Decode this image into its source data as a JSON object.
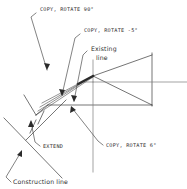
{
  "diagram": {
    "background_color": "#ffffff",
    "line_color": "#3a3a3a",
    "accent_line_color": "#7d7d7d",
    "width": 187,
    "height": 189,
    "labels": {
      "copy_rotate_90": "COPY, ROTATE 90°",
      "copy_rotate_minus5": "COPY, ROTATE -5°",
      "existing_line_1": "Existing",
      "existing_line_2": "line",
      "extend": "EXTEND",
      "copy_rotate_6": "COPY, ROTATE 6°",
      "construction_line": "Construction line"
    },
    "annotations": [
      {
        "name": "copy-rotate-90",
        "text": "COPY, ROTATE 90°",
        "style": "uppercase",
        "text_x": 40,
        "text_y": 11,
        "leader": "M36,12 L31,16 L47,70",
        "arrow_at": [
          47,
          70
        ],
        "arrow_angle": 75
      },
      {
        "name": "copy-rotate-minus5",
        "text": "COPY, ROTATE -5°",
        "style": "uppercase",
        "text_x": 82,
        "text_y": 32,
        "leader": "M79,33 L74,37 L61,96",
        "arrow_at": [
          61,
          96
        ],
        "arrow_angle": 100
      },
      {
        "name": "existing-line",
        "text": "Existing line",
        "style": "mixed",
        "text_x": 90,
        "text_y": 51,
        "leader": "M86,50 L82,54 L73,103",
        "arrow_at": [
          73,
          103
        ],
        "arrow_angle": 100
      },
      {
        "name": "extend",
        "text": "EXTEND",
        "style": "uppercase",
        "text_x": 42,
        "text_y": 147,
        "leader": "M40,145 L35,141 L31,120",
        "arrow_at": [
          31,
          120
        ],
        "arrow_angle": 260
      },
      {
        "name": "copy-rotate-6",
        "text": "COPY, ROTATE 6°",
        "style": "uppercase",
        "text_x": 104,
        "text_y": 146,
        "leader": "M102,144 L97,140 L70,106",
        "arrow_at": [
          70,
          106
        ],
        "arrow_angle": 230
      },
      {
        "name": "construction-line",
        "text": "Construction line",
        "style": "mixed",
        "text_x": 12,
        "text_y": 183,
        "leader": "M10,181 L6,176 L21,150",
        "arrow_at": [
          21,
          150
        ],
        "arrow_angle": 300
      }
    ],
    "geometry": {
      "apex": [
        93,
        76
      ],
      "triangle_right_top": [
        152,
        55
      ],
      "triangle_right_bottom": [
        152,
        105
      ],
      "baseline_y": 105,
      "baseline_x_start": 48,
      "horizontal_ray_y": 82,
      "horizontal_ray_x_end": 187,
      "vertical_line_x": 93,
      "vertical_line_y_top": 60,
      "vertical_line_y_bottom": 172,
      "construction_line_start": [
        4,
        118
      ],
      "construction_line_end": [
        62,
        178
      ],
      "fan_lines_count": 4
    }
  }
}
